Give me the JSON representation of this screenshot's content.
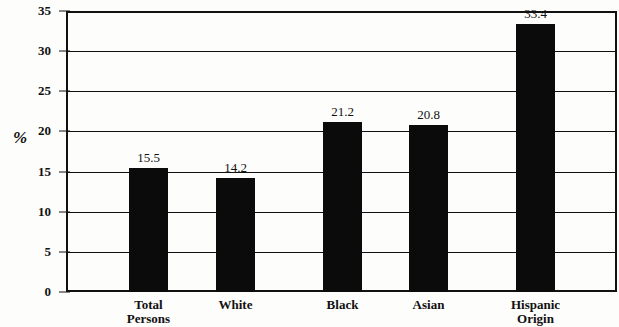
{
  "chart_data": {
    "type": "bar",
    "title": "",
    "xlabel": "",
    "ylabel": "%",
    "categories": [
      "Total Persons",
      "White",
      "Black",
      "Asian",
      "Hispanic Origin"
    ],
    "values": [
      15.5,
      14.2,
      21.2,
      20.8,
      33.4
    ],
    "value_labels": [
      "15.5",
      "14.2",
      "21.2",
      "20.8",
      "33.4"
    ],
    "ylim": [
      0,
      35
    ],
    "ytick_values": [
      0,
      5,
      10,
      15,
      20,
      25,
      30,
      35
    ],
    "ytick_labels": [
      "0",
      "5",
      "10",
      "15",
      "20",
      "25",
      "30",
      "35"
    ],
    "grid": true,
    "legend": false,
    "bar_color": "#0b0b0b",
    "axis_color": "#111111",
    "background_color": "#fdfdfb"
  }
}
